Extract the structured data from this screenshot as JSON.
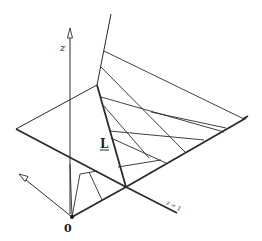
{
  "figure": {
    "labels": {
      "z_axis": "z",
      "line_L": "L",
      "origin": "0",
      "plane_z1": "z = 1"
    },
    "colors": {
      "ink": "#2a2a2a",
      "background": "#ffffff"
    }
  }
}
